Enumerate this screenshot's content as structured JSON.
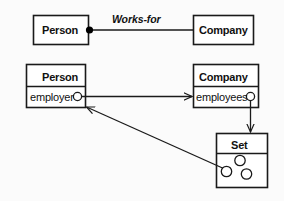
{
  "diagram": {
    "canvas": {
      "width": 284,
      "height": 201
    },
    "colors": {
      "background": "#fbfbfb",
      "stroke": "#1a1a1a",
      "text": "#111111",
      "box_fill": "#ffffff",
      "marker_fill": "#000000"
    },
    "class_level": {
      "person_box": {
        "label": "Person"
      },
      "company_box": {
        "label": "Company"
      },
      "association": {
        "label": "Works-for",
        "source_marker": "filled-dot",
        "target_marker": "none"
      }
    },
    "object_level": {
      "person_object": {
        "header": "Person",
        "slots": [
          {
            "name": "employer",
            "marker": "hollow-circle"
          }
        ]
      },
      "company_object": {
        "header": "Company",
        "slots": [
          {
            "name": "employees",
            "marker": "hollow-circle"
          }
        ]
      },
      "set_object": {
        "header": "Set",
        "elements": [
          {
            "marker": "hollow-circle"
          },
          {
            "marker": "hollow-circle"
          },
          {
            "marker": "hollow-circle"
          }
        ]
      },
      "links": [
        {
          "name": "employer-to-company",
          "from": "person_object.employer",
          "to": "company_object",
          "style": "solid",
          "arrowhead": "open"
        },
        {
          "name": "employees-to-set",
          "from": "company_object.employees",
          "to": "set_object",
          "style": "solid",
          "arrowhead": "open"
        },
        {
          "name": "set-element-to-person",
          "from": "set_object.element",
          "to": "person_object",
          "style": "solid",
          "arrowhead": "open"
        }
      ]
    }
  }
}
